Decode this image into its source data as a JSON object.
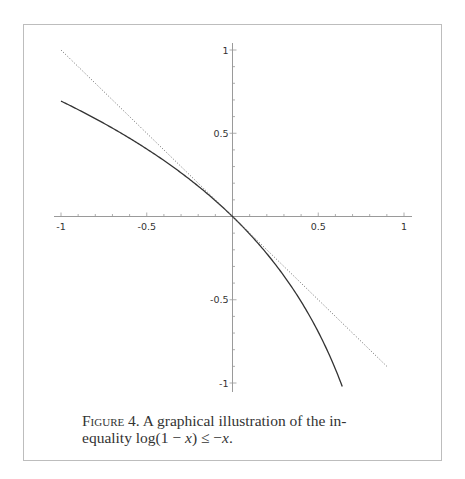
{
  "chart_data": {
    "type": "line",
    "title": "",
    "xlabel": "",
    "ylabel": "",
    "xlim": [
      -1,
      1
    ],
    "ylim": [
      -1,
      1
    ],
    "grid": false,
    "x_ticks": [
      "-1",
      "-0.5",
      "0.5",
      "1"
    ],
    "y_ticks": [
      "1",
      "0.5",
      "-0.5",
      "-1"
    ],
    "series": [
      {
        "name": "log(1 - x)",
        "style": "solid",
        "color": "#333333",
        "x": [
          -1,
          -0.8,
          -0.6,
          -0.4,
          -0.2,
          0,
          0.2,
          0.4,
          0.5,
          0.6,
          0.64
        ],
        "y": [
          0.693,
          0.588,
          0.47,
          0.336,
          0.182,
          0,
          -0.223,
          -0.511,
          -0.693,
          -0.916,
          -1.02
        ]
      },
      {
        "name": "-x",
        "style": "dotted",
        "color": "#666666",
        "x": [
          -1,
          0.9
        ],
        "y": [
          1,
          -0.9
        ]
      }
    ]
  },
  "caption": {
    "figure_label": "Figure 4.",
    "text_before": "A graphical illustration of the in-equality log(1 − ",
    "full_text": "FIGURE 4. A graphical illustration of the inequality log(1 − x) ≤ −x.",
    "line1": "A graphical illustration of the in-",
    "line2_prefix": "equality log(1 − ",
    "var_x": "x",
    "line2_mid": ") ≤ −",
    "line2_end": "."
  }
}
